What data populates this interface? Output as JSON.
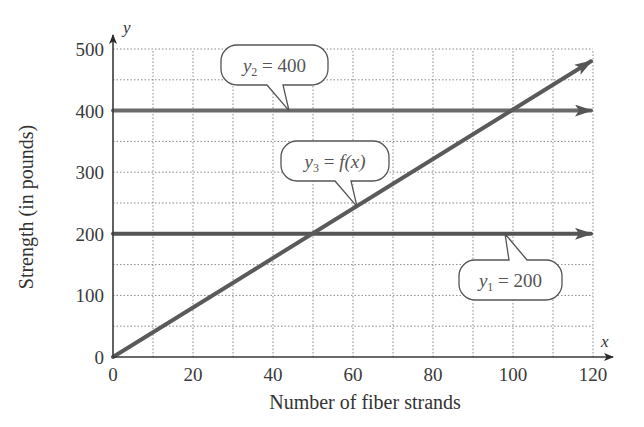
{
  "chart_data": {
    "type": "line",
    "title": "",
    "xlabel": "Number of fiber strands",
    "ylabel": "Strength (in pounds)",
    "x_axis_var": "x",
    "y_axis_var": "y",
    "xlim": [
      0,
      120
    ],
    "ylim": [
      0,
      500
    ],
    "x_ticks": [
      0,
      20,
      40,
      60,
      80,
      100,
      120
    ],
    "y_ticks": [
      0,
      100,
      200,
      300,
      400,
      500
    ],
    "x_tick_labels": [
      "0",
      "20",
      "40",
      "60",
      "80",
      "100",
      "120"
    ],
    "y_tick_labels": [
      "0",
      "100",
      "200",
      "300",
      "400",
      "500"
    ],
    "x_grid_step": 10,
    "y_grid_step": 50,
    "grid": true,
    "legend": "none",
    "series": [
      {
        "name": "y1",
        "label_var": "y",
        "label_sub": "1",
        "label_rest": " = 200",
        "x": [
          0,
          120
        ],
        "y": [
          200,
          200
        ],
        "arrow_end": true,
        "callout_anchor_x": 98,
        "color": "#555555"
      },
      {
        "name": "y2",
        "label_var": "y",
        "label_sub": "2",
        "label_rest": " = 400",
        "x": [
          0,
          120
        ],
        "y": [
          400,
          400
        ],
        "arrow_end": true,
        "callout_anchor_x": 44,
        "color": "#6a6a6a"
      },
      {
        "name": "y3",
        "label_var": "y",
        "label_sub": "3",
        "label_rest": " = f(x)",
        "x": [
          0,
          120
        ],
        "y": [
          0,
          480
        ],
        "arrow_end": true,
        "callout_anchor_x": 61,
        "color": "#5a5a5a"
      }
    ],
    "annotations": [
      {
        "text": "y2 = 400",
        "points_to": "y2"
      },
      {
        "text": "y3 = f(x)",
        "points_to": "y3"
      },
      {
        "text": "y1 = 200",
        "points_to": "y1"
      }
    ]
  }
}
